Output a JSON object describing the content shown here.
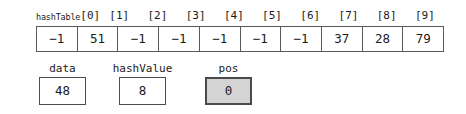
{
  "diagram": {
    "array": {
      "name_prefix": "hashTable",
      "index_labels": [
        "[0]",
        "[1]",
        "[2]",
        "[3]",
        "[4]",
        "[5]",
        "[6]",
        "[7]",
        "[8]",
        "[9]"
      ],
      "cells": [
        "−1",
        "51",
        "−1",
        "−1",
        "−1",
        "−1",
        "−1",
        "37",
        "28",
        "79"
      ]
    },
    "variables": [
      {
        "label": "data",
        "value": "48",
        "highlighted": false
      },
      {
        "label": "hashValue",
        "value": "8",
        "highlighted": false
      },
      {
        "label": "pos",
        "value": "0",
        "highlighted": true
      }
    ],
    "colors": {
      "border": "#59595b",
      "box_border": "#4d4d4f",
      "highlight_fill": "#d4d4d4",
      "background": "#ffffff",
      "text": "#1a1a1a"
    }
  }
}
